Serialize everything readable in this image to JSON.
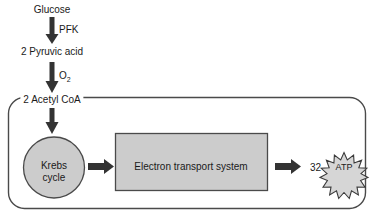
{
  "diagram": {
    "colors": {
      "stroke": "#3a3a3a",
      "fill_gray": "#cccccc",
      "arrow": "#333333",
      "text": "#1a1a1a",
      "background": "#ffffff"
    },
    "nodes": {
      "glucose": "Glucose",
      "pyruvic_acid": "2 Pyruvic acid",
      "acetyl_coa": "2 Acetyl CoA",
      "krebs_line1": "Krebs",
      "krebs_line2": "cycle",
      "electron_transport_system": "Electron transport system",
      "atp_count": "32",
      "atp": "ATP"
    },
    "arrow_labels": {
      "pfk": "PFK",
      "oxygen": "O",
      "oxygen_subscript": "2"
    },
    "flow": [
      {
        "from": "Glucose",
        "to": "2 Pyruvic acid",
        "label": "PFK"
      },
      {
        "from": "2 Pyruvic acid",
        "to": "2 Acetyl CoA",
        "label": "O2"
      },
      {
        "from": "2 Acetyl CoA",
        "to": "Krebs cycle",
        "label": ""
      },
      {
        "from": "Krebs cycle",
        "to": "Electron transport system",
        "label": ""
      },
      {
        "from": "Electron transport system",
        "to": "32 ATP",
        "label": ""
      }
    ]
  }
}
